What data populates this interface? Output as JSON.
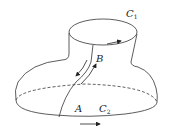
{
  "diagram": {
    "labels": {
      "c1": "C",
      "c1_sub": "1",
      "c2": "C",
      "c2_sub": "2",
      "a": "A",
      "b": "B"
    },
    "colors": {
      "stroke": "#333333",
      "background": "#ffffff"
    }
  }
}
